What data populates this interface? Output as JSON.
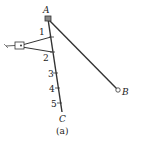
{
  "diagram": {
    "points": {
      "A": {
        "label": "A"
      },
      "B": {
        "label": "B"
      },
      "C": {
        "label": "C"
      }
    },
    "ticks": [
      {
        "label": "1"
      },
      {
        "label": "2"
      },
      {
        "label": "3"
      },
      {
        "label": "4"
      },
      {
        "label": "5"
      }
    ],
    "caption": "(a)",
    "colors": {
      "line": "#333333",
      "background": "#ffffff"
    }
  }
}
